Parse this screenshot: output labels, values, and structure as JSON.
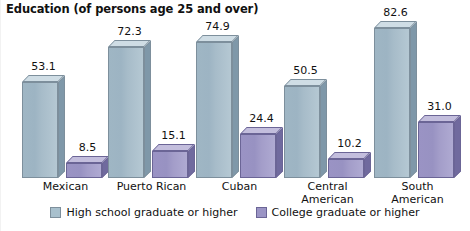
{
  "chart_data": {
    "type": "bar",
    "title": "Education (of persons age 25 and over)",
    "subtitle": "",
    "xlabel": "",
    "ylabel": "",
    "ylim": [
      0,
      90
    ],
    "grid": false,
    "legend_position": "bottom-center",
    "three_d": true,
    "value_labels": true,
    "categories": [
      "Mexican",
      "Puerto Rican",
      "Cuban",
      "Central American",
      "South American"
    ],
    "category_lines": [
      [
        "Mexican"
      ],
      [
        "Puerto Rican"
      ],
      [
        "Cuban"
      ],
      [
        "Central",
        "American"
      ],
      [
        "South",
        "American"
      ]
    ],
    "series": [
      {
        "name": "High school graduate or higher",
        "color": "#a8c0cd",
        "values": [
          53.1,
          72.3,
          74.9,
          50.5,
          82.6
        ],
        "labels": [
          "53.1",
          "72.3",
          "74.9",
          "50.5",
          "82.6"
        ]
      },
      {
        "name": "College graduate or higher",
        "color": "#9b95c5",
        "values": [
          8.5,
          15.1,
          24.4,
          10.2,
          31.0
        ],
        "labels": [
          "8.5",
          "15.1",
          "24.4",
          "10.2",
          "31.0"
        ]
      }
    ]
  },
  "legend": {
    "items": [
      {
        "label": "High school graduate or higher",
        "color": "#a8c0cd"
      },
      {
        "label": "College graduate or higher",
        "color": "#9b95c5"
      }
    ]
  },
  "colors": {
    "series_a": "#a8c0cd",
    "series_b": "#9b95c5",
    "background": "#ffffff",
    "text": "#111111"
  }
}
